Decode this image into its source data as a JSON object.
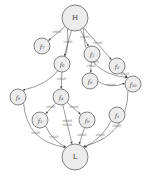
{
  "diagram": {
    "type": "directed-graph",
    "nodes": [
      {
        "id": "H",
        "label": "H",
        "x": 75,
        "y": 18,
        "r": 13
      },
      {
        "id": "f7",
        "label": "f₇",
        "x": 42,
        "y": 46,
        "r": 8
      },
      {
        "id": "f6",
        "label": "f₆",
        "x": 62,
        "y": 64,
        "r": 8
      },
      {
        "id": "f5",
        "label": "f₅",
        "x": 92,
        "y": 54,
        "r": 8
      },
      {
        "id": "f2",
        "label": "f₂",
        "x": 117,
        "y": 66,
        "r": 8
      },
      {
        "id": "f9",
        "label": "f₉",
        "x": 90,
        "y": 81,
        "r": 8
      },
      {
        "id": "f10",
        "label": "f₁₀",
        "x": 133,
        "y": 84,
        "r": 8
      },
      {
        "id": "f8",
        "label": "f₈",
        "x": 18,
        "y": 97,
        "r": 8
      },
      {
        "id": "f4",
        "label": "f₄",
        "x": 61,
        "y": 97,
        "r": 8
      },
      {
        "id": "f3",
        "label": "f₃",
        "x": 40,
        "y": 120,
        "r": 8
      },
      {
        "id": "fg",
        "label": "f₈",
        "x": 87,
        "y": 120,
        "r": 8
      },
      {
        "id": "f1",
        "label": "f₁",
        "x": 117,
        "y": 115,
        "r": 8
      },
      {
        "id": "L",
        "label": "L",
        "x": 75,
        "y": 157,
        "r": 13
      }
    ],
    "edges": [
      {
        "from": "H",
        "to": "f8",
        "label": "VMAR"
      },
      {
        "from": "H",
        "to": "f7",
        "label": "VMAR"
      },
      {
        "from": "H",
        "to": "f6",
        "label": "VMAR"
      },
      {
        "from": "H",
        "to": "f5",
        "label": "VMAR"
      },
      {
        "from": "H",
        "to": "f2",
        "label": "VMAR"
      },
      {
        "from": "H",
        "to": "f10",
        "label": "VMAR"
      },
      {
        "from": "f6",
        "to": "f4",
        "label": "VMAR"
      },
      {
        "from": "f5",
        "to": "f9",
        "label": "VMAR"
      },
      {
        "from": "f2",
        "to": "f10",
        "label": "VMAR"
      },
      {
        "from": "f9",
        "to": "f10",
        "label": "VMAR"
      },
      {
        "from": "f4",
        "to": "f3",
        "label": "VMAR"
      },
      {
        "from": "f4",
        "to": "fg",
        "label": "VMAR"
      },
      {
        "from": "f4",
        "to": "L",
        "label": "MMAR SMAR"
      },
      {
        "from": "f8",
        "to": "L",
        "label": "VMAR"
      },
      {
        "from": "f3",
        "to": "L",
        "label": "VMAR"
      },
      {
        "from": "fg",
        "to": "L",
        "label": "VMAR"
      },
      {
        "from": "f1",
        "to": "L",
        "label": "VMAR"
      },
      {
        "from": "f10",
        "to": "L",
        "label": "VMAR"
      }
    ]
  }
}
